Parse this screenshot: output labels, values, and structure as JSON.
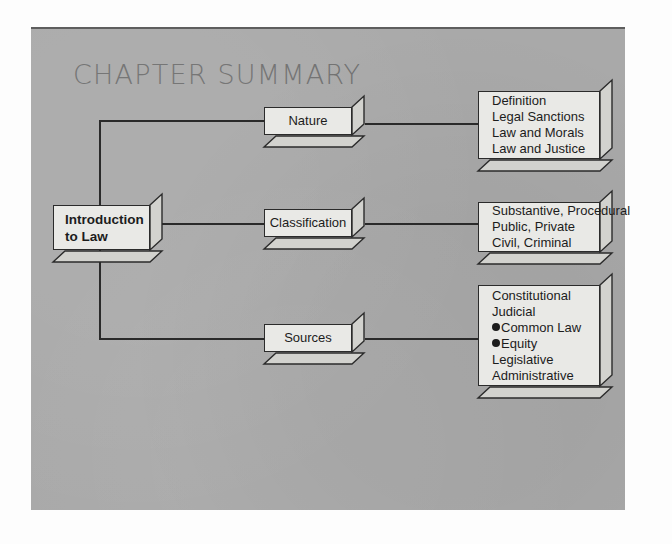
{
  "panel": {
    "title": "CHAPTER SUMMARY",
    "bg_color": "#a9a9a9",
    "box_fill": "#e9e9e6",
    "line_color": "#2a2a2a"
  },
  "diagram": {
    "type": "tree",
    "root": {
      "label_line1": "Introduction",
      "label_line2": "to Law"
    },
    "branches": [
      {
        "category": "Nature",
        "details": [
          {
            "text": "Definition",
            "bullet": false
          },
          {
            "text": "Legal Sanctions",
            "bullet": false
          },
          {
            "text": "Law and Morals",
            "bullet": false
          },
          {
            "text": "Law and Justice",
            "bullet": false
          }
        ]
      },
      {
        "category": "Classification",
        "details": [
          {
            "text": "Substantive, Procedural",
            "bullet": false
          },
          {
            "text": "Public, Private",
            "bullet": false
          },
          {
            "text": "Civil, Criminal",
            "bullet": false
          }
        ]
      },
      {
        "category": "Sources",
        "details": [
          {
            "text": "Constitutional",
            "bullet": false
          },
          {
            "text": "Judicial",
            "bullet": false
          },
          {
            "text": "Common Law",
            "bullet": true
          },
          {
            "text": "Equity",
            "bullet": true
          },
          {
            "text": "Legislative",
            "bullet": false
          },
          {
            "text": "Administrative",
            "bullet": false
          }
        ]
      }
    ]
  }
}
